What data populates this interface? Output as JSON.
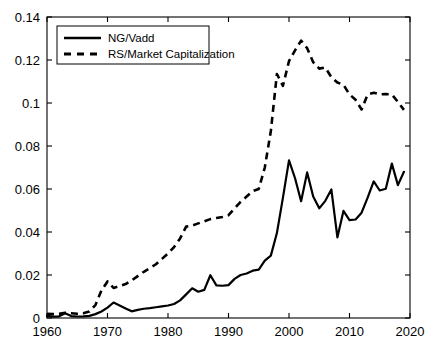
{
  "chart_data": {
    "type": "line",
    "title": "",
    "xlabel": "",
    "ylabel": "",
    "xlim": [
      1960,
      2020
    ],
    "ylim": [
      0,
      0.14
    ],
    "xticks": [
      1960,
      1970,
      1980,
      1990,
      2000,
      2010,
      2020
    ],
    "xtick_labels": [
      "1960",
      "1970",
      "1980",
      "1990",
      "2000",
      "2010",
      "2020"
    ],
    "yticks": [
      0,
      0.02,
      0.04,
      0.06,
      0.08,
      0.1,
      0.12,
      0.14
    ],
    "ytick_labels": [
      "0",
      "0.02",
      "0.04",
      "0.06",
      "0.08",
      "0.1",
      "0.12",
      "0.14"
    ],
    "grid": false,
    "legend_position": "upper-left-inside",
    "background_color": "#ffffff",
    "axis_color": "#000000",
    "x": [
      1960,
      1961,
      1962,
      1963,
      1964,
      1965,
      1966,
      1967,
      1968,
      1969,
      1970,
      1971,
      1972,
      1973,
      1974,
      1975,
      1976,
      1977,
      1978,
      1979,
      1980,
      1981,
      1982,
      1983,
      1984,
      1985,
      1986,
      1987,
      1988,
      1989,
      1990,
      1991,
      1992,
      1993,
      1994,
      1995,
      1996,
      1997,
      1998,
      1999,
      2000,
      2001,
      2002,
      2003,
      2004,
      2005,
      2006,
      2007,
      2008,
      2009,
      2010,
      2011,
      2012,
      2013,
      2014,
      2015,
      2016,
      2017,
      2018,
      2019
    ],
    "series": [
      {
        "name": "NG/Vadd",
        "style": "solid",
        "color": "#000000",
        "values": [
          0.001,
          0.0006,
          0.0008,
          0.0022,
          0.0009,
          0.0007,
          0.0008,
          0.001,
          0.0018,
          0.003,
          0.0048,
          0.0072,
          0.0058,
          0.0044,
          0.0031,
          0.0038,
          0.0043,
          0.0046,
          0.005,
          0.0054,
          0.0058,
          0.0065,
          0.0082,
          0.011,
          0.0138,
          0.0122,
          0.0131,
          0.0199,
          0.0152,
          0.015,
          0.0153,
          0.0182,
          0.02,
          0.0207,
          0.022,
          0.0225,
          0.0267,
          0.029,
          0.0395,
          0.056,
          0.0733,
          0.065,
          0.0543,
          0.0677,
          0.0565,
          0.051,
          0.0545,
          0.0598,
          0.0375,
          0.0498,
          0.0455,
          0.0458,
          0.049,
          0.056,
          0.0635,
          0.0593,
          0.0601,
          0.0718,
          0.0618,
          0.068
        ]
      },
      {
        "name": "RS/Market Capitalization",
        "style": "dashed",
        "color": "#000000",
        "values": [
          0.002,
          0.0018,
          0.002,
          0.0024,
          0.0022,
          0.002,
          0.0022,
          0.003,
          0.006,
          0.0128,
          0.017,
          0.014,
          0.0148,
          0.0158,
          0.0175,
          0.0195,
          0.0215,
          0.0232,
          0.025,
          0.0275,
          0.03,
          0.033,
          0.037,
          0.0425,
          0.043,
          0.044,
          0.045,
          0.046,
          0.0465,
          0.047,
          0.0478,
          0.051,
          0.054,
          0.0565,
          0.059,
          0.06,
          0.07,
          0.087,
          0.1135,
          0.108,
          0.1195,
          0.1245,
          0.129,
          0.1255,
          0.119,
          0.116,
          0.1165,
          0.112,
          0.1095,
          0.1085,
          0.104,
          0.1015,
          0.097,
          0.104,
          0.1048,
          0.104,
          0.1042,
          0.104,
          0.1005,
          0.0968
        ]
      }
    ]
  },
  "legend": {
    "entries": [
      {
        "label": "NG/Vadd",
        "style": "solid"
      },
      {
        "label": "RS/Market Capitalization",
        "style": "dashed"
      }
    ]
  }
}
